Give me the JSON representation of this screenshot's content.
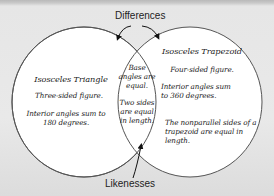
{
  "diagram": {
    "type": "venn",
    "labels": {
      "top": "Differences",
      "bottom": "Likenesses"
    },
    "left_circle": {
      "title": "Isosceles Triangle",
      "facts": [
        "Three-sided figure.",
        "Interior angles sum to 180 degrees."
      ]
    },
    "right_circle": {
      "title": "Isosceles Trapezoid",
      "facts": [
        "Four-sided figure.",
        "Interior angles sum to 360 degrees.",
        "The nonparallel sides of a trapezoid are equal in length."
      ]
    },
    "overlap": {
      "facts": [
        "Base angles are equal.",
        "Two sides are equal in length."
      ]
    },
    "colors": {
      "background": "#e6e6e6",
      "circle_fill": "#ffffff",
      "stroke": "#555555",
      "text": "#222222"
    }
  }
}
